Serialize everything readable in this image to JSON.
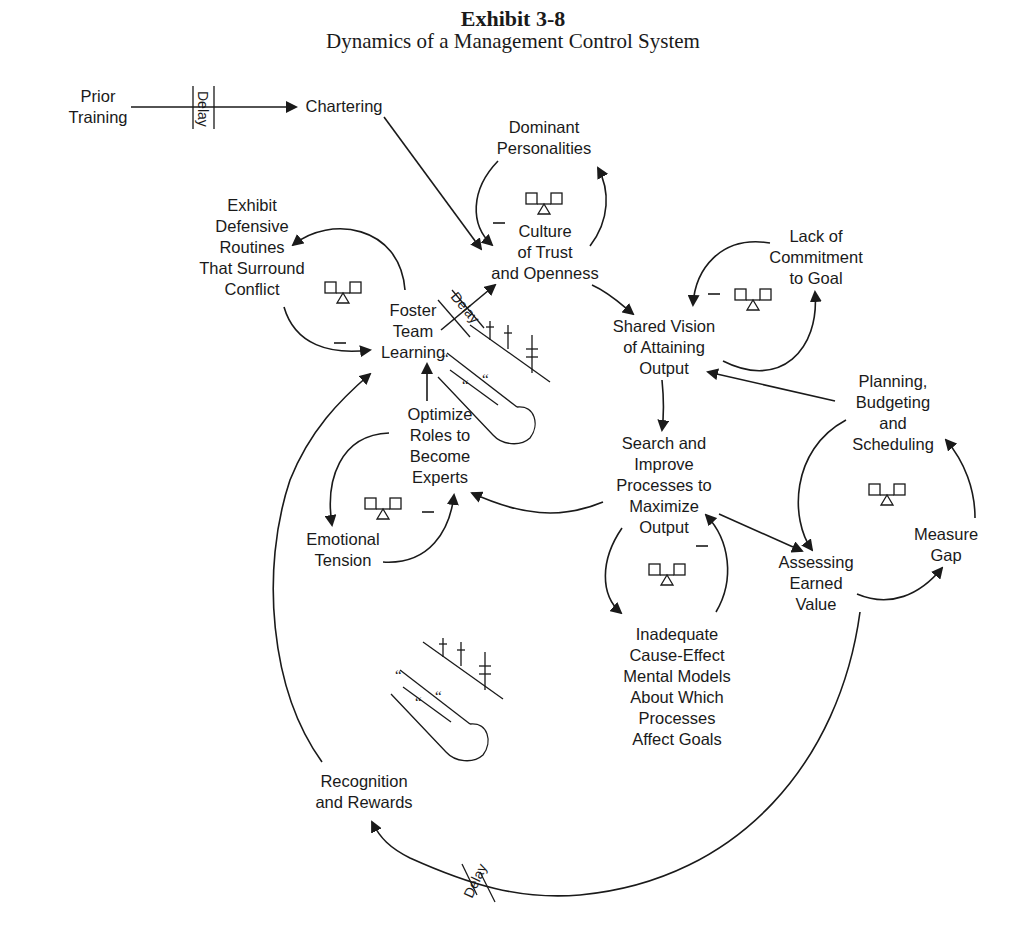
{
  "header": {
    "exhibit": "Exhibit 3-8",
    "title": "Dynamics of a Management Control System"
  },
  "nodes": {
    "prior_training": [
      "Prior",
      "Training"
    ],
    "chartering": [
      "Chartering"
    ],
    "dominant_personalities": [
      "Dominant",
      "Personalities"
    ],
    "culture_trust": [
      "Culture",
      "of Trust",
      "and Openness"
    ],
    "exhibit_defensive": [
      "Exhibit",
      "Defensive",
      "Routines",
      "That Surround",
      "Conflict"
    ],
    "foster_team_learning": [
      "Foster",
      "Team",
      "Learning"
    ],
    "lack_commitment": [
      "Lack of",
      "Commitment",
      "to Goal"
    ],
    "shared_vision": [
      "Shared Vision",
      "of Attaining",
      "Output"
    ],
    "planning_budgeting": [
      "Planning,",
      "Budgeting",
      "and",
      "Scheduling"
    ],
    "optimize_roles": [
      "Optimize",
      "Roles to",
      "Become",
      "Experts"
    ],
    "search_improve": [
      "Search and",
      "Improve",
      "Processes to",
      "Maximize",
      "Output"
    ],
    "measure_gap": [
      "Measure",
      "Gap"
    ],
    "assessing_earned_value": [
      "Assessing",
      "Earned",
      "Value"
    ],
    "emotional_tension": [
      "Emotional",
      "Tension"
    ],
    "inadequate_models": [
      "Inadequate",
      "Cause-Effect",
      "Mental Models",
      "About Which",
      "Processes",
      "Affect Goals"
    ],
    "recognition_rewards": [
      "Recognition",
      "and Rewards"
    ]
  },
  "markers": {
    "delay_label": "Delay",
    "polarity_negative": "–",
    "balancing_loops": [
      "dominant-personalities-loop",
      "defensive-routines-loop",
      "lack-of-commitment-loop",
      "planning-loop",
      "emotional-tension-loop",
      "mental-models-loop"
    ],
    "delays": [
      "prior-training-to-chartering",
      "foster-learning-to-culture",
      "earned-value-to-recognition"
    ]
  },
  "icons": {
    "ski_slope_icon_count": 2,
    "balance_scale_icon_count": 6
  },
  "colors": {
    "ink": "#1a1a1a",
    "background": "#ffffff"
  }
}
